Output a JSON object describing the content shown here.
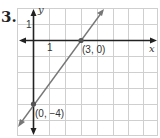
{
  "problem_number": "3.",
  "graph": {
    "x_axis_label": "x",
    "y_axis_label": "y",
    "x_tick_label": "1",
    "y_tick_label": "1",
    "points": [
      {
        "label": "(3, 0)",
        "x": 3,
        "y": 0
      },
      {
        "label": "(0, −4)",
        "x": 0,
        "y": -4
      }
    ],
    "line_color": "#777777",
    "axis_color": "#222222",
    "grid_color": "#cccccc"
  }
}
